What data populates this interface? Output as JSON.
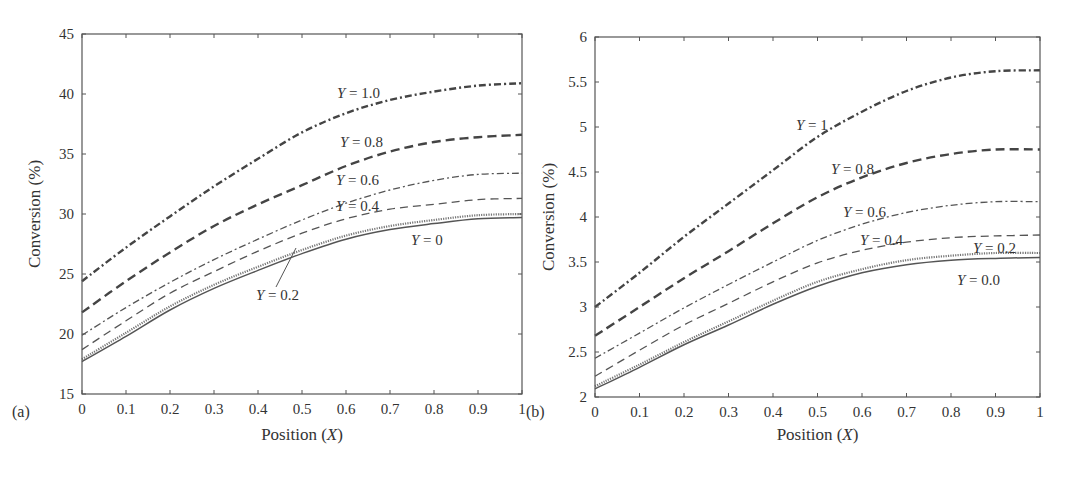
{
  "chart_data": [
    {
      "type": "line",
      "panel_label": "(a)",
      "title": "",
      "xlabel": "Position (X)",
      "ylabel": "Conversion (%)",
      "xlim": [
        0,
        1
      ],
      "ylim": [
        15,
        45
      ],
      "grid": false,
      "xticks": [
        "0",
        "0.1",
        "0.2",
        "0.3",
        "0.4",
        "0.5",
        "0.6",
        "0.7",
        "0.8",
        "0.9",
        "1"
      ],
      "yticks": [
        "15",
        "20",
        "25",
        "30",
        "35",
        "40",
        "45"
      ],
      "x": [
        0,
        0.1,
        0.2,
        0.3,
        0.4,
        0.5,
        0.6,
        0.7,
        0.8,
        0.9,
        1.0
      ],
      "series": [
        {
          "name": "Y = 1.0",
          "style": "dashdot-heavy",
          "values": [
            24.4,
            27.2,
            29.8,
            32.3,
            34.6,
            36.8,
            38.4,
            39.5,
            40.2,
            40.7,
            40.9
          ]
        },
        {
          "name": "Y = 0.8",
          "style": "dash-heavy",
          "values": [
            21.8,
            24.4,
            26.8,
            29.0,
            30.8,
            32.4,
            34.0,
            35.2,
            36.0,
            36.4,
            36.6
          ]
        },
        {
          "name": "Y = 0.6",
          "style": "dashdot-light",
          "values": [
            19.9,
            22.2,
            24.3,
            26.2,
            27.9,
            29.5,
            30.9,
            32.0,
            32.8,
            33.3,
            33.4
          ]
        },
        {
          "name": "Y = 0.4",
          "style": "dash-light",
          "values": [
            18.7,
            21.1,
            23.4,
            25.2,
            26.9,
            28.4,
            29.6,
            30.4,
            30.8,
            31.2,
            31.3
          ]
        },
        {
          "name": "Y = 0.2",
          "style": "dotted",
          "values": [
            17.9,
            20.1,
            22.3,
            24.1,
            25.6,
            27.0,
            28.2,
            29.0,
            29.5,
            29.9,
            30.0
          ]
        },
        {
          "name": "Y = 0",
          "style": "solid",
          "values": [
            17.7,
            19.8,
            22.0,
            23.8,
            25.3,
            26.7,
            27.9,
            28.7,
            29.2,
            29.6,
            29.7
          ]
        }
      ],
      "annotations": [
        {
          "text": "Y = 1.0",
          "x": 337,
          "y": 98
        },
        {
          "text": "Y = 0.8",
          "x": 340,
          "y": 147
        },
        {
          "text": "Y = 0.6",
          "x": 336,
          "y": 185
        },
        {
          "text": "Y = 0.4",
          "x": 336,
          "y": 211
        },
        {
          "text": "Y = 0",
          "x": 411,
          "y": 245
        },
        {
          "text": "Y = 0.2",
          "x": 256,
          "y": 300
        }
      ]
    },
    {
      "type": "line",
      "panel_label": "(b)",
      "title": "",
      "xlabel": "Position (X)",
      "ylabel": "Conversion (%)",
      "xlim": [
        0,
        1
      ],
      "ylim": [
        2,
        6
      ],
      "grid": false,
      "xticks": [
        "0",
        "0.1",
        "0.2",
        "0.3",
        "0.4",
        "0.5",
        "0.6",
        "0.7",
        "0.8",
        "0.9",
        "1"
      ],
      "yticks": [
        "2",
        "2.5",
        "3",
        "3.5",
        "4",
        "4.5",
        "5",
        "5.5",
        "6"
      ],
      "x": [
        0,
        0.1,
        0.2,
        0.3,
        0.4,
        0.5,
        0.6,
        0.7,
        0.8,
        0.9,
        1.0
      ],
      "series": [
        {
          "name": "Y = 1",
          "style": "dashdot-heavy",
          "values": [
            3.0,
            3.38,
            3.78,
            4.15,
            4.52,
            4.89,
            5.17,
            5.4,
            5.55,
            5.62,
            5.63
          ]
        },
        {
          "name": "Y = 0.8",
          "style": "dash-heavy",
          "values": [
            2.68,
            3.0,
            3.32,
            3.62,
            3.93,
            4.22,
            4.44,
            4.6,
            4.7,
            4.75,
            4.75
          ]
        },
        {
          "name": "Y = 0.6",
          "style": "dashdot-light",
          "values": [
            2.43,
            2.71,
            2.99,
            3.25,
            3.5,
            3.74,
            3.92,
            4.05,
            4.13,
            4.17,
            4.17
          ]
        },
        {
          "name": "Y = 0.4",
          "style": "dash-light",
          "values": [
            2.23,
            2.52,
            2.8,
            3.04,
            3.28,
            3.49,
            3.63,
            3.72,
            3.77,
            3.79,
            3.8
          ]
        },
        {
          "name": "Y = 0.2",
          "style": "dotted",
          "values": [
            2.12,
            2.36,
            2.61,
            2.84,
            3.07,
            3.28,
            3.42,
            3.52,
            3.57,
            3.6,
            3.6
          ]
        },
        {
          "name": "Y = 0.0",
          "style": "solid",
          "values": [
            2.09,
            2.33,
            2.58,
            2.8,
            3.03,
            3.23,
            3.38,
            3.47,
            3.52,
            3.54,
            3.55
          ]
        }
      ],
      "annotations": [
        {
          "text": "Y = 1",
          "x": 796,
          "y": 130
        },
        {
          "text": "Y = 0.8",
          "x": 831,
          "y": 174
        },
        {
          "text": "Y = 0.6",
          "x": 843,
          "y": 217
        },
        {
          "text": "Y = 0.4",
          "x": 860,
          "y": 245
        },
        {
          "text": "Y = 0.2",
          "x": 973,
          "y": 253
        },
        {
          "text": "Y = 0.0",
          "x": 957,
          "y": 285
        }
      ]
    }
  ]
}
